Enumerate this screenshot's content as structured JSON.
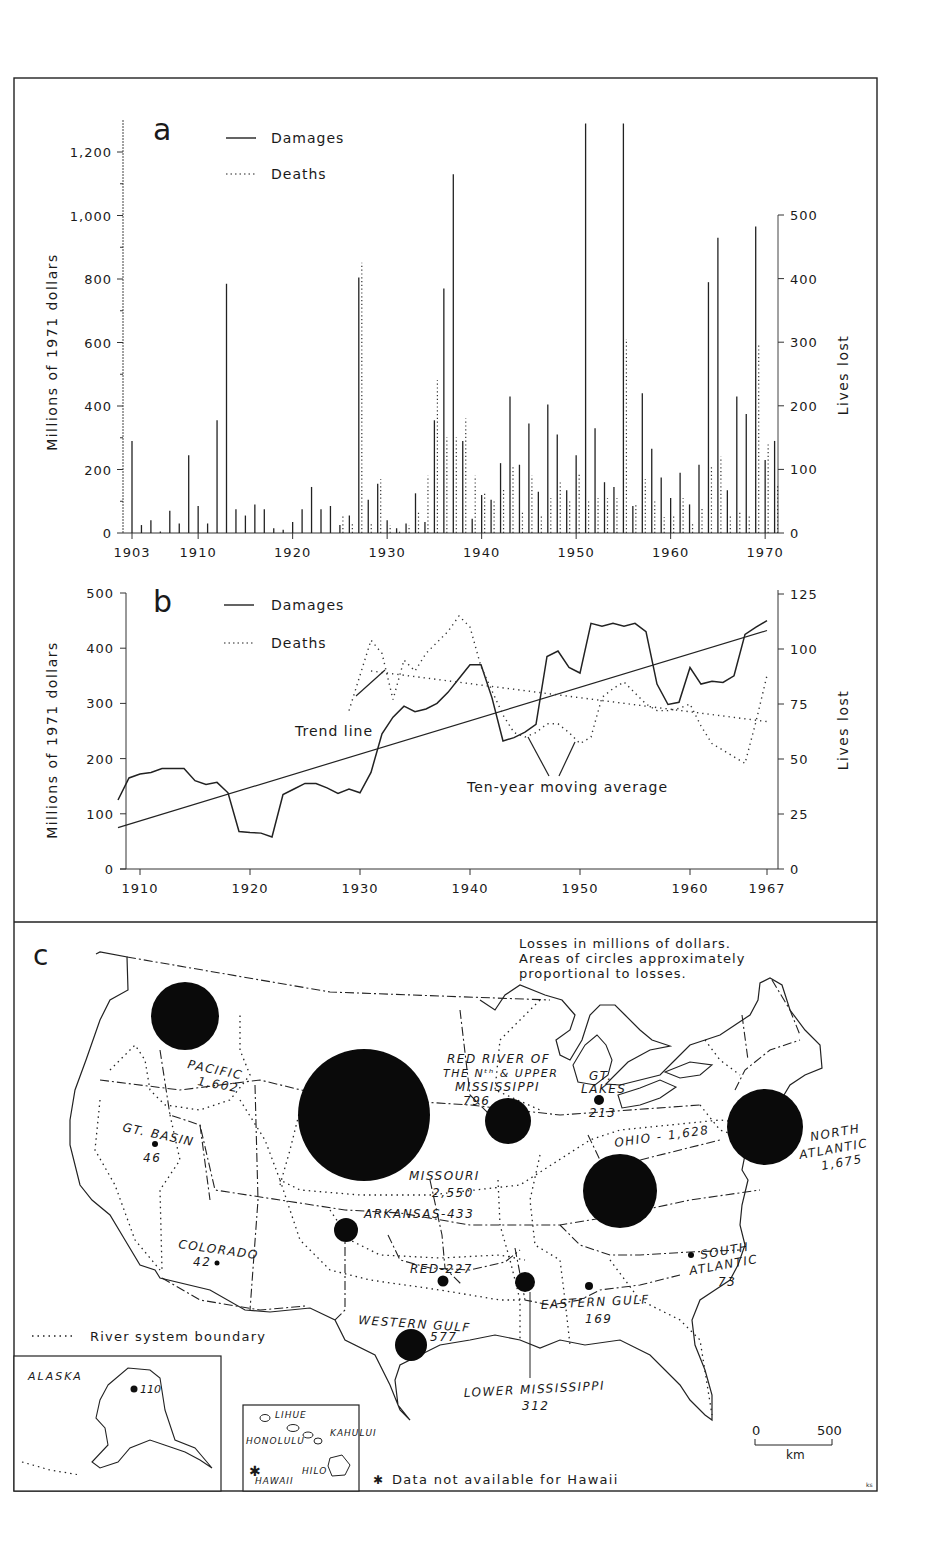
{
  "chart_data": [
    {
      "panel": "a",
      "type": "bar",
      "title": "",
      "panel_label": "a",
      "xlabel": "",
      "ylabel": "Millions of 1971 dollars",
      "ylabel_right": "Lives lost",
      "ylim": [
        0,
        1300
      ],
      "ylim_right": [
        0,
        650
      ],
      "yticks": [
        0,
        200,
        400,
        600,
        800,
        1000,
        1200
      ],
      "yticks_labels": [
        "0",
        "200",
        "400",
        "600",
        "800",
        "1,000",
        "1,200"
      ],
      "yticks_right": [
        0,
        100,
        200,
        300,
        400,
        500
      ],
      "xticks": [
        "1903",
        "1910",
        "1920",
        "1930",
        "1940",
        "1950",
        "1960",
        "1970"
      ],
      "legend": [
        "Damages",
        "Deaths"
      ],
      "grid": false,
      "x": [
        1903,
        1904,
        1905,
        1906,
        1907,
        1908,
        1909,
        1910,
        1911,
        1912,
        1913,
        1914,
        1915,
        1916,
        1917,
        1918,
        1919,
        1920,
        1921,
        1922,
        1923,
        1924,
        1925,
        1926,
        1927,
        1928,
        1929,
        1930,
        1931,
        1932,
        1933,
        1934,
        1935,
        1936,
        1937,
        1938,
        1939,
        1940,
        1941,
        1942,
        1943,
        1944,
        1945,
        1946,
        1947,
        1948,
        1949,
        1950,
        1951,
        1952,
        1953,
        1954,
        1955,
        1956,
        1957,
        1958,
        1959,
        1960,
        1961,
        1962,
        1963,
        1964,
        1965,
        1966,
        1967,
        1968,
        1969,
        1970,
        1971
      ],
      "series": [
        {
          "name": "Damages",
          "axis": "left",
          "unit": "millions of 1971 dollars",
          "values": [
            290,
            25,
            40,
            5,
            70,
            30,
            245,
            85,
            30,
            355,
            785,
            75,
            55,
            90,
            75,
            15,
            10,
            35,
            75,
            145,
            75,
            85,
            25,
            55,
            805,
            105,
            155,
            40,
            15,
            30,
            125,
            35,
            355,
            770,
            1130,
            290,
            45,
            120,
            105,
            220,
            430,
            215,
            345,
            130,
            405,
            310,
            135,
            245,
            1290,
            330,
            160,
            145,
            1290,
            85,
            440,
            265,
            175,
            110,
            190,
            90,
            215,
            790,
            930,
            135,
            430,
            375,
            965,
            230,
            290
          ]
        },
        {
          "name": "Deaths",
          "axis": "right",
          "unit": "lives lost",
          "values": [
            0,
            0,
            0,
            0,
            0,
            0,
            0,
            0,
            0,
            0,
            0,
            0,
            0,
            0,
            0,
            0,
            0,
            0,
            0,
            0,
            0,
            0,
            30,
            15,
            425,
            15,
            85,
            12,
            5,
            12,
            35,
            90,
            240,
            150,
            150,
            180,
            90,
            65,
            50,
            70,
            105,
            35,
            90,
            30,
            55,
            80,
            50,
            95,
            50,
            55,
            55,
            55,
            305,
            45,
            85,
            50,
            25,
            30,
            55,
            15,
            40,
            105,
            120,
            30,
            35,
            30,
            295,
            140,
            75
          ]
        }
      ]
    },
    {
      "panel": "b",
      "type": "line",
      "title": "",
      "panel_label": "b",
      "xlabel": "",
      "ylabel": "Millions of 1971 dollars",
      "ylabel_right": "Lives lost",
      "ylim": [
        0,
        500
      ],
      "ylim_right": [
        0,
        125
      ],
      "yticks": [
        0,
        100,
        200,
        300,
        400,
        500
      ],
      "yticks_right": [
        0,
        25,
        50,
        75,
        100,
        125
      ],
      "xticks": [
        "1910",
        "1920",
        "1930",
        "1940",
        "1950",
        "1960",
        "1967"
      ],
      "legend": [
        "Damages",
        "Deaths"
      ],
      "annotations": [
        "Trend line",
        "Ten-year moving average"
      ],
      "grid": false,
      "x": [
        1908,
        1909,
        1910,
        1911,
        1912,
        1913,
        1914,
        1915,
        1916,
        1917,
        1918,
        1919,
        1920,
        1921,
        1922,
        1923,
        1924,
        1925,
        1926,
        1927,
        1928,
        1929,
        1930,
        1931,
        1932,
        1933,
        1934,
        1935,
        1936,
        1937,
        1938,
        1939,
        1940,
        1941,
        1942,
        1943,
        1944,
        1945,
        1946,
        1947,
        1948,
        1949,
        1950,
        1951,
        1952,
        1953,
        1954,
        1955,
        1956,
        1957,
        1958,
        1959,
        1960,
        1961,
        1962,
        1963,
        1964,
        1965,
        1966,
        1967
      ],
      "series": [
        {
          "name": "Damages ten-year moving average",
          "axis": "left",
          "values": [
            125,
            165,
            172,
            175,
            182,
            182,
            182,
            160,
            153,
            157,
            138,
            68,
            66,
            65,
            58,
            135,
            145,
            155,
            155,
            147,
            137,
            145,
            138,
            175,
            245,
            275,
            295,
            285,
            290,
            300,
            320,
            345,
            370,
            370,
            310,
            232,
            238,
            248,
            262,
            385,
            395,
            365,
            355,
            445,
            440,
            445,
            440,
            445,
            430,
            335,
            298,
            302,
            365,
            335,
            340,
            338,
            350,
            425,
            438,
            450
          ]
        },
        {
          "name": "Damages trend line",
          "axis": "left",
          "values_endpoints": [
            [
              1908,
              75
            ],
            [
              1967,
              432
            ]
          ]
        },
        {
          "name": "Deaths ten-year moving average",
          "axis": "right",
          "x": [
            1929,
            1930,
            1931,
            1932,
            1933,
            1934,
            1935,
            1936,
            1937,
            1938,
            1939,
            1940,
            1941,
            1942,
            1943,
            1944,
            1945,
            1946,
            1947,
            1948,
            1949,
            1950,
            1951,
            1952,
            1953,
            1954,
            1955,
            1956,
            1957,
            1958,
            1959,
            1960,
            1961,
            1962,
            1963,
            1964,
            1965,
            1966,
            1967
          ],
          "values": [
            72,
            88,
            104,
            98,
            77,
            95,
            90,
            98,
            103,
            108,
            115,
            110,
            92,
            81,
            70,
            62,
            60,
            62,
            66,
            66,
            62,
            57,
            60,
            78,
            82,
            85,
            80,
            75,
            72,
            72,
            73,
            75,
            65,
            57,
            54,
            51,
            48,
            67,
            88
          ]
        },
        {
          "name": "Deaths trend line",
          "axis": "right",
          "values_endpoints": [
            [
              1931,
              90
            ],
            [
              1967,
              67
            ]
          ]
        }
      ]
    }
  ],
  "map": {
    "panel_label": "c",
    "note_lines": [
      "Losses in millions of dollars.",
      "Areas of circles approximately",
      "proportional to losses."
    ],
    "legend_boundary": "River system boundary",
    "hawaii_note": "Data not available for Hawaii",
    "scale": {
      "start": "0",
      "end": "500",
      "unit": "km"
    },
    "credit": "ks",
    "regions": [
      {
        "name": "PACIFIC",
        "value": "1,602"
      },
      {
        "name": "GT. BASIN",
        "value": "46"
      },
      {
        "name": "COLORADO",
        "value": "42"
      },
      {
        "name": "MISSOURI",
        "value": "2,550"
      },
      {
        "name": "ARKANSAS",
        "value": "433"
      },
      {
        "name": "RED",
        "value": "227"
      },
      {
        "name": "WESTERN GULF",
        "value": "577"
      },
      {
        "name": "LOWER MISSISSIPPI",
        "value": "312"
      },
      {
        "name": "EASTERN GULF",
        "value": "169"
      },
      {
        "name": "SOUTH ATLANTIC",
        "value": "73"
      },
      {
        "name": "OHIO",
        "value": "1,628"
      },
      {
        "name": "NORTH ATLANTIC",
        "value": "1,675"
      },
      {
        "name": "GT. LAKES",
        "value": "213"
      },
      {
        "name": "RED RIVER OF THE Nth & UPPER MISSISSIPPI",
        "value": "796"
      }
    ],
    "labels": {
      "pacific": "PACIFIC",
      "pacific_v": "1,602",
      "gtbasin": "GT. BASIN",
      "gtbasin_v": "46",
      "colorado": "COLORADO",
      "colorado_v": "42",
      "missouri": "MISSOURI",
      "missouri_v": "2,550",
      "arkansas": "ARKANSAS-433",
      "red": "RED-227",
      "wgulf": "WESTERN GULF",
      "wgulf_v": "577",
      "lmiss": "LOWER MISSISSIPPI",
      "lmiss_v": "312",
      "egulf": "EASTERN GULF",
      "egulf_v": "169",
      "satl_1": "SOUTH",
      "satl_2": "ATLANTIC",
      "satl_v": "73",
      "ohio": "OHIO - 1,628",
      "natl_1": "NORTH",
      "natl_2": "ATLANTIC",
      "natl_v": "1,675",
      "gtlakes_1": "GT.",
      "gtlakes_2": "LAKES",
      "gtlakes_v": "213",
      "rrn_1": "RED RIVER OF",
      "rrn_2": "THE Nᵗʰ & UPPER",
      "rrn_3": "MISSISSIPPI",
      "rrn_v": "796"
    },
    "insets": {
      "alaska": {
        "label": "ALASKA",
        "value": "110"
      },
      "hawaii": {
        "places": [
          "LIHUE",
          "HONOLULU",
          "KAHULUI",
          "HILO",
          "HAWAII"
        ]
      }
    }
  },
  "legend_a": {
    "damages": "Damages",
    "deaths": "Deaths"
  },
  "legend_b": {
    "damages": "Damages",
    "deaths": "Deaths"
  },
  "axis_labels": {
    "left": "Millions of 1971 dollars",
    "right": "Lives lost"
  },
  "panel_labels": {
    "a": "a",
    "b": "b",
    "c": "c"
  },
  "annotations_b": {
    "trend": "Trend line",
    "moving": "Ten-year moving average"
  }
}
